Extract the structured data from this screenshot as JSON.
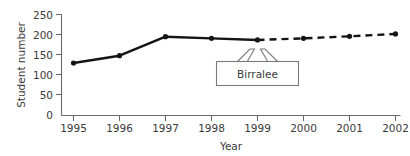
{
  "chart_data": {
    "type": "line",
    "title": "",
    "xlabel": "Year",
    "ylabel": "Student number",
    "categories": [
      "1995",
      "1996",
      "1997",
      "1998",
      "1999",
      "2000",
      "2001",
      "2002"
    ],
    "x": [
      1995,
      1996,
      1997,
      1998,
      1999,
      2000,
      2001,
      2002
    ],
    "ylim": [
      0,
      250
    ],
    "xlim": [
      1995,
      2002
    ],
    "yticks": [
      0,
      50,
      100,
      150,
      200,
      250
    ],
    "ytick_labels": [
      "0",
      "50",
      "100",
      "150",
      "200",
      "250"
    ],
    "xtick_labels": [
      "1995",
      "1996",
      "1997",
      "1998",
      "1999",
      "2000",
      "2001",
      "2002"
    ],
    "grid": false,
    "legend": false,
    "series": [
      {
        "name": "Birralee actual",
        "style": "solid",
        "marker": "filled-circle",
        "color": "#141414",
        "x": [
          1995,
          1996,
          1997,
          1998,
          1999
        ],
        "values": [
          130,
          148,
          195,
          191,
          187
        ]
      },
      {
        "name": "Birralee projected",
        "style": "dashed",
        "marker": "filled-circle",
        "color": "#141414",
        "x": [
          1999,
          2000,
          2001,
          2002
        ],
        "values": [
          187,
          191,
          196,
          202
        ]
      }
    ],
    "annotations": [
      {
        "label": "Birralee",
        "points_to": [
          "1999"
        ],
        "shape": "box-with-two-arrows"
      }
    ]
  },
  "axes": {
    "y_title": "Student number",
    "x_title": "Year",
    "y_ticks": [
      "250",
      "200",
      "150",
      "100",
      "50",
      "0"
    ],
    "x_ticks": [
      "1995",
      "1996",
      "1997",
      "1998",
      "1999",
      "2000",
      "2001",
      "2002"
    ]
  },
  "annotation": {
    "birralee_label": "Birralee"
  },
  "colors": {
    "line": "#141414",
    "axis": "#6b6b6b",
    "text": "#3a3a3a",
    "callout_border": "#7a7a7a",
    "background": "#ffffff"
  }
}
